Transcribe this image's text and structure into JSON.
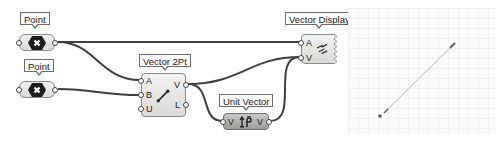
{
  "canvas": {
    "components": {
      "point_1": {
        "label": "Point",
        "icon": "point-param-icon",
        "output": ""
      },
      "point_2": {
        "label": "Point",
        "icon": "point-param-icon",
        "output": ""
      },
      "vector_2pt": {
        "label": "Vector 2Pt",
        "icon": "vector-2pt-icon",
        "inputs": [
          "A",
          "B",
          "U"
        ],
        "outputs": [
          "V",
          "L"
        ]
      },
      "unit_vector": {
        "label": "Unit Vector",
        "icon": "unit-vector-icon",
        "inputs": [
          "V"
        ],
        "outputs": [
          "V"
        ]
      },
      "vector_display": {
        "label": "Vector Display",
        "icon": "vector-display-icon",
        "inputs": [
          "A",
          "V"
        ]
      }
    },
    "wires": [
      {
        "from": "point_1.out",
        "to": "vector_display.A"
      },
      {
        "from": "point_1.out",
        "to": "vector_2pt.A"
      },
      {
        "from": "point_2.out",
        "to": "vector_2pt.B"
      },
      {
        "from": "vector_2pt.V",
        "to": "vector_display.V"
      },
      {
        "from": "vector_2pt.V",
        "to": "unit_vector.V"
      },
      {
        "from": "unit_vector.V",
        "to": "vector_display.V"
      }
    ],
    "colors": {
      "wire": "#3f3f3f",
      "component_fill": "#e6e6e6",
      "component_dark_fill": "#b4b4b4",
      "viewport_bg": "#fbfbfb"
    }
  },
  "viewport": {
    "points": [
      {
        "x": 32,
        "y": 108
      },
      {
        "x": 106,
        "y": 36
      }
    ],
    "vector_line": {
      "x1": 38,
      "y1": 103,
      "x2": 106,
      "y2": 36
    }
  }
}
